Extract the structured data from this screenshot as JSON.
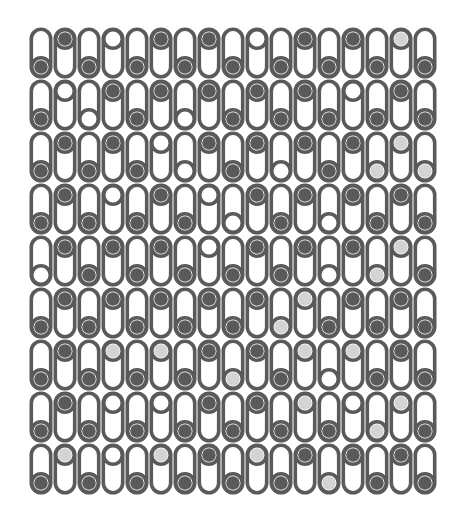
{
  "board": {
    "columns": 17,
    "rows": 9,
    "origin": [
      29,
      27
    ],
    "cell_width": 24,
    "cell_height": 52,
    "colors": {
      "outline": "#5a5a5a",
      "background": "#ffffff",
      "dark_ball": "#5a5a5a",
      "light_ball": "#d4d4d4",
      "empty_ball": "#ffffff"
    },
    "legend": {
      "D": "dark",
      "L": "light",
      "E": "empty"
    },
    "ball_position_rule": "odd columns: bottom slot; even columns: top slot",
    "cells": [
      "DDDEDDDDDEDDDDDLD",
      "DEEDDDEDDDDDDEDDD",
      "DDDDDEEDDDEDDDLLL",
      "DDDEDDDEEDDDEDDDD",
      "EDDDDDDEDDDDEDLLD",
      "DDDDDDDDDDLLDDDDD",
      "DDDLDLDDLDDLELDDD",
      "DDDEDEDDDDDLDELLD",
      "DLDEDLDDDLDDLDDDD"
    ]
  }
}
